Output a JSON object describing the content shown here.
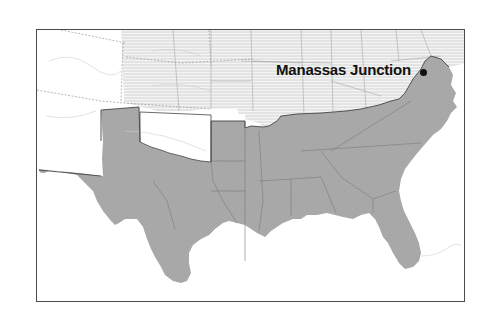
{
  "map": {
    "title": "",
    "colors": {
      "confederate_fill": "#a9a9a9",
      "union_hatch": "#d6d6d6",
      "territory_fill": "#ffffff",
      "border_dark": "#444444",
      "border_light": "#9a9a9a",
      "frame": "#4a4a4a",
      "label": "#111111"
    },
    "regions": [
      {
        "name": "Confederate States",
        "style": "gray-filled"
      },
      {
        "name": "Union States",
        "style": "horizontal-hatched"
      },
      {
        "name": "Western Territories",
        "style": "white"
      }
    ],
    "places": [
      {
        "name": "Manassas Junction",
        "marker": "dot",
        "label_x": 276,
        "label_y": 61,
        "dot_x": 420,
        "dot_y": 69
      }
    ]
  }
}
